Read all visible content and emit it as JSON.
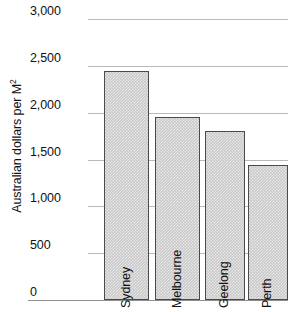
{
  "chart_data": {
    "type": "bar",
    "title": "",
    "xlabel": "",
    "ylabel": "Australian dollars per M",
    "ylabel_superscript": "2",
    "categories": [
      "Sydney",
      "Melbourne",
      "Geelong",
      "Perth"
    ],
    "values": [
      2440,
      1950,
      1800,
      1440
    ],
    "ylim": [
      0,
      3000
    ],
    "yticks": [
      0,
      500,
      1000,
      1500,
      2000,
      2500,
      3000
    ],
    "ytick_labels": [
      "0",
      "500",
      "1,000",
      "1,500",
      "2,000",
      "2,500",
      "3,000"
    ],
    "grid": true,
    "legend": false,
    "bar_fill_color": "#c9c9c9",
    "bar_border_color": "#4a4a4a",
    "gridline_color": "#b9b9b9",
    "axis_color": "#8f8f8f",
    "text_color": "#111111"
  }
}
